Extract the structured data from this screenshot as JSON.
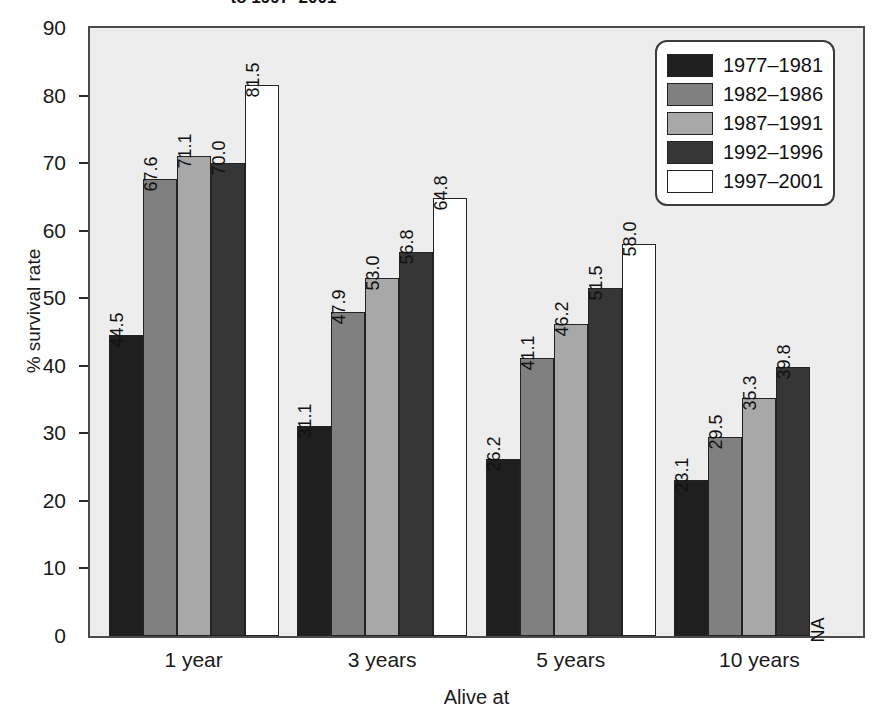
{
  "title_clipped": "to 1997–2001",
  "axes": {
    "ylabel": "% survival rate",
    "xlabel": "Alive at",
    "yticks": [
      "0",
      "10",
      "20",
      "30",
      "40",
      "50",
      "60",
      "70",
      "80",
      "90"
    ],
    "xticks": [
      "1 year",
      "3 years",
      "5 years",
      "10 years"
    ]
  },
  "legend": {
    "items": [
      {
        "label": "1977–1981",
        "color": "#1f1f1f"
      },
      {
        "label": "1982–1986",
        "color": "#808080"
      },
      {
        "label": "1987–1991",
        "color": "#a8a8a8"
      },
      {
        "label": "1992–1996",
        "color": "#363636"
      },
      {
        "label": "1997–2001",
        "color": "#ffffff"
      }
    ]
  },
  "na_text": "NA",
  "chart_data": {
    "type": "bar",
    "title": "to 1997–2001",
    "xlabel": "Alive at",
    "ylabel": "% survival rate",
    "ylim": [
      0,
      90
    ],
    "ytick_step": 10,
    "grid": false,
    "legend_position": "top-right",
    "categories": [
      "1 year",
      "3 years",
      "5 years",
      "10 years"
    ],
    "series": [
      {
        "name": "1977–1981",
        "color": "#1f1f1f",
        "values": [
          44.5,
          31.1,
          26.2,
          23.1
        ],
        "labels": [
          "44.5",
          "31.1",
          "26.2",
          "23.1"
        ]
      },
      {
        "name": "1982–1986",
        "color": "#808080",
        "values": [
          67.6,
          47.9,
          41.1,
          29.5
        ],
        "labels": [
          "67.6",
          "47.9",
          "41.1",
          "29.5"
        ]
      },
      {
        "name": "1987–1991",
        "color": "#a8a8a8",
        "values": [
          71.1,
          53.0,
          46.2,
          35.3
        ],
        "labels": [
          "71.1",
          "53.0",
          "46.2",
          "35.3"
        ]
      },
      {
        "name": "1992–1996",
        "color": "#363636",
        "values": [
          70.0,
          56.8,
          51.5,
          39.8
        ],
        "labels": [
          "70.0",
          "56.8",
          "51.5",
          "39.8"
        ]
      },
      {
        "name": "1997–2001",
        "color": "#ffffff",
        "values": [
          81.5,
          64.8,
          58.0,
          null
        ],
        "labels": [
          "81.5",
          "64.8",
          "58.0",
          "NA"
        ]
      }
    ]
  }
}
